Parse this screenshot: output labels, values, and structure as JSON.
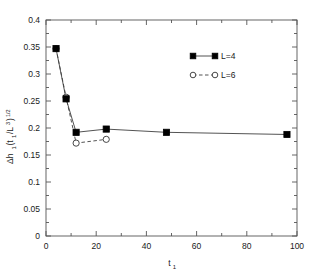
{
  "chart_data": {
    "type": "line",
    "title": "",
    "xlabel": "t1",
    "xlabel_base": "t",
    "xlabel_sub": "1",
    "ylabel": "Δh1(t1/L^3)^1/2",
    "ylabel_parts": {
      "delta_h": "Δh",
      "sub1": "1",
      "open_paren": "(t",
      "sub2": "1",
      "slash_L": "/L",
      "sup3": "3",
      "close_paren": ")",
      "sup_half": "1/2"
    },
    "xlim": [
      0,
      100
    ],
    "ylim": [
      0,
      0.4
    ],
    "xticks": [
      0,
      20,
      40,
      60,
      80,
      100
    ],
    "xtick_labels": [
      "0",
      "20",
      "40",
      "60",
      "80",
      "100"
    ],
    "yticks": [
      0,
      0.05,
      0.1,
      0.15,
      0.2,
      0.25,
      0.3,
      0.35,
      0.4
    ],
    "ytick_labels": [
      "0",
      "0.05",
      "0.1",
      "0.15",
      "0.2",
      "0.25",
      "0.3",
      "0.35",
      "0.4"
    ],
    "x_minor_count": 1,
    "y_minor_count": 1,
    "grid": false,
    "legend_position": "top-right",
    "series": [
      {
        "name": "L=4",
        "label": "L=4",
        "marker": "filled-square",
        "linestyle": "solid",
        "color": "#000000",
        "x": [
          4,
          8,
          12,
          24,
          48,
          96
        ],
        "y": [
          0.347,
          0.254,
          0.192,
          0.198,
          0.192,
          0.188
        ]
      },
      {
        "name": "L=6",
        "label": "L=6",
        "marker": "open-circle",
        "linestyle": "dashed",
        "color": "#333333",
        "x": [
          4,
          8,
          12,
          24
        ],
        "y": [
          0.347,
          0.257,
          0.172,
          0.179
        ]
      }
    ]
  },
  "legend": {
    "entries": [
      {
        "label": "L=4",
        "marker": "filled-square",
        "linestyle": "solid"
      },
      {
        "label": "L=6",
        "marker": "open-circle",
        "linestyle": "dashed"
      }
    ]
  },
  "axes": {
    "x_title": "t",
    "x_title_sub": "1",
    "y_title_main": "Δh",
    "y_title_sub1": "1",
    "y_title_mid": "(t",
    "y_title_sub2": "1",
    "y_title_mid2": "/L",
    "y_title_sup": "3",
    "y_title_close": ")",
    "y_title_exp": "1/2"
  }
}
